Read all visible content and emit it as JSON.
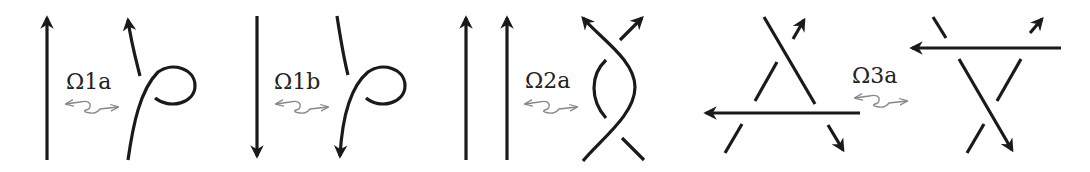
{
  "moves": [
    {
      "id": "omega1a",
      "label": "Ω1a"
    },
    {
      "id": "omega1b",
      "label": "Ω1b"
    },
    {
      "id": "omega2a",
      "label": "Ω2a"
    },
    {
      "id": "omega3a",
      "label": "Ω3a"
    }
  ],
  "colors": {
    "stroke": "#1a1a1a",
    "equivalence_arrow": "#888888"
  }
}
